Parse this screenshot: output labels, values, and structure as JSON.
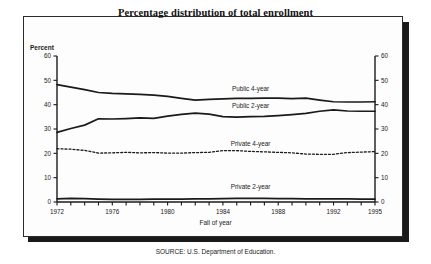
{
  "figure": {
    "title": "Percentage distribution of total enrollment",
    "source": "SOURCE: U.S. Department of Education.",
    "percent_axis_label": "Percent",
    "xaxis_title": "Fall of year"
  },
  "chart_data": {
    "type": "line",
    "title": "Percentage distribution of total enrollment",
    "xlabel": "Fall of year",
    "ylabel": "Percent",
    "ylim": [
      0,
      60
    ],
    "xlim": [
      1972,
      1995
    ],
    "grid": false,
    "legend": "inline-labels",
    "ytick_labels": [
      "0",
      "10",
      "20",
      "30",
      "40",
      "50",
      "60"
    ],
    "ytick_values": [
      0,
      10,
      20,
      30,
      40,
      50,
      60
    ],
    "xtick_labels": [
      "1972",
      "1976",
      "1980",
      "1984",
      "1988",
      "1992",
      "1995"
    ],
    "xtick_values": [
      1972,
      1976,
      1980,
      1984,
      1988,
      1992,
      1995
    ],
    "x": [
      1972,
      1973,
      1974,
      1975,
      1976,
      1977,
      1978,
      1979,
      1980,
      1981,
      1982,
      1983,
      1984,
      1985,
      1986,
      1987,
      1988,
      1989,
      1990,
      1991,
      1992,
      1993,
      1994,
      1995
    ],
    "series": [
      {
        "name": "Public 4-year",
        "style": "solid",
        "color": "#1a1a1a",
        "label_x": 1986,
        "label_y": 46.5,
        "values": [
          48.2,
          47.2,
          46.2,
          45.0,
          44.6,
          44.4,
          44.2,
          43.9,
          43.4,
          42.6,
          41.9,
          42.2,
          42.4,
          42.6,
          42.6,
          42.7,
          42.7,
          42.5,
          42.7,
          41.9,
          41.2,
          41.1,
          41.1,
          41.2
        ],
        "ylabel_axis": "percent"
      },
      {
        "name": "Public 2-year",
        "style": "solid",
        "color": "#1a1a1a",
        "label_x": 1986,
        "label_y": 39.5,
        "values": [
          28.6,
          30.2,
          31.6,
          34.2,
          34.1,
          34.3,
          34.6,
          34.4,
          35.3,
          36.0,
          36.5,
          36.1,
          35.1,
          34.9,
          35.1,
          35.2,
          35.5,
          35.9,
          36.4,
          37.3,
          37.9,
          37.4,
          37.3,
          37.3
        ],
        "ylabel_axis": "percent"
      },
      {
        "name": "Private 4-year",
        "style": "dashed",
        "color": "#1a1a1a",
        "label_x": 1986,
        "label_y": 23.8,
        "values": [
          21.9,
          21.7,
          21.2,
          20.1,
          20.2,
          20.4,
          20.2,
          20.3,
          20.1,
          20.1,
          20.3,
          20.4,
          21.1,
          21.1,
          20.8,
          20.6,
          20.4,
          20.2,
          19.7,
          19.6,
          19.6,
          20.3,
          20.5,
          20.7
        ],
        "ylabel_axis": "percent"
      },
      {
        "name": "Private 2-year",
        "style": "solid",
        "color": "#1a1a1a",
        "label_x": 1986,
        "label_y": 6.0,
        "values": [
          1.3,
          1.5,
          1.4,
          1.2,
          1.1,
          1.1,
          1.1,
          1.2,
          1.2,
          1.2,
          1.3,
          1.3,
          1.4,
          1.5,
          1.5,
          1.5,
          1.4,
          1.4,
          1.3,
          1.3,
          1.3,
          1.3,
          1.2,
          1.2
        ],
        "ylabel_axis": "percent"
      }
    ]
  }
}
